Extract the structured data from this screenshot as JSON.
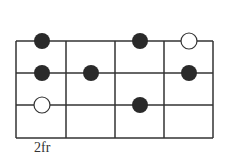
{
  "diagram": {
    "type": "fretboard",
    "fret_label": "2fr",
    "strings": 4,
    "frets": 4,
    "grid": {
      "x0": 16,
      "y0": 41,
      "cell_w": 49.25,
      "cell_h": 32.3
    },
    "colors": {
      "line": "#333333",
      "filled": "#2a2a2a",
      "open_fill": "#ffffff"
    },
    "dots": [
      {
        "row": 0,
        "x": 42,
        "type": "filled"
      },
      {
        "row": 0,
        "x": 140,
        "type": "filled"
      },
      {
        "row": 0,
        "x": 189,
        "type": "open"
      },
      {
        "row": 1,
        "x": 42,
        "type": "filled"
      },
      {
        "row": 1,
        "x": 91,
        "type": "filled"
      },
      {
        "row": 1,
        "x": 189,
        "type": "filled"
      },
      {
        "row": 2,
        "x": 42,
        "type": "open"
      },
      {
        "row": 2,
        "x": 140,
        "type": "filled"
      }
    ]
  }
}
